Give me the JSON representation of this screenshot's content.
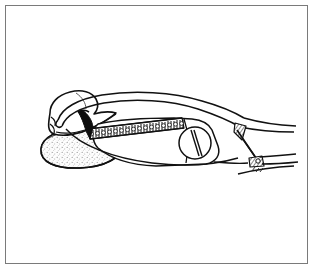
{
  "figure": {
    "title": "Line-art illustration of a serrated surgical forceps grasping soft tissue",
    "caption": "",
    "background_color": "#ffffff",
    "ink_color": "#000000",
    "frame_color": "#7a7a7a",
    "stipple_color": "#8c8c8c",
    "style": "black-and-white pen-and-ink medical line drawing",
    "frame": {
      "x": 5,
      "y": 5,
      "width": 303,
      "height": 259,
      "border_width_px": 1
    },
    "parts": [
      {
        "id": "tissue-mass",
        "label": "soft tissue mass",
        "texture": "stippled",
        "position": "lower-left"
      },
      {
        "id": "tissue-flap",
        "label": "overlying tissue flap",
        "texture": "outline",
        "position": "upper-left"
      },
      {
        "id": "upper-jaw",
        "label": "upper curved jaw",
        "texture": "outline",
        "position": "center-left arcing right"
      },
      {
        "id": "lower-jaw-serrated",
        "label": "serrated lower jaw",
        "texture": "serrated teeth",
        "tooth_count": 34,
        "position": "center"
      },
      {
        "id": "jaw-tip-hook",
        "label": "dark hooked jaw tip",
        "texture": "solid fill",
        "position": "left of serrations"
      },
      {
        "id": "shank-body",
        "label": "instrument shank body",
        "texture": "outline",
        "position": "center-right"
      },
      {
        "id": "hinge-screw",
        "label": "slotted hinge screw",
        "texture": "circle with slot",
        "position": "center-right",
        "center_x": 189,
        "center_y": 137,
        "radius": 16
      },
      {
        "id": "upper-handle-arm",
        "label": "upper handle arm",
        "texture": "outline",
        "position": "extending to right edge"
      },
      {
        "id": "lower-handle-arm",
        "label": "lower handle arm",
        "texture": "outline",
        "position": "extending to right edge"
      },
      {
        "id": "joint-hatching-upper",
        "label": "cross-hatched joint shading (upper)",
        "texture": "hatching",
        "position": "right"
      },
      {
        "id": "joint-hatching-lower",
        "label": "cross-hatched joint shading (lower)",
        "texture": "hatching",
        "position": "right"
      }
    ]
  }
}
